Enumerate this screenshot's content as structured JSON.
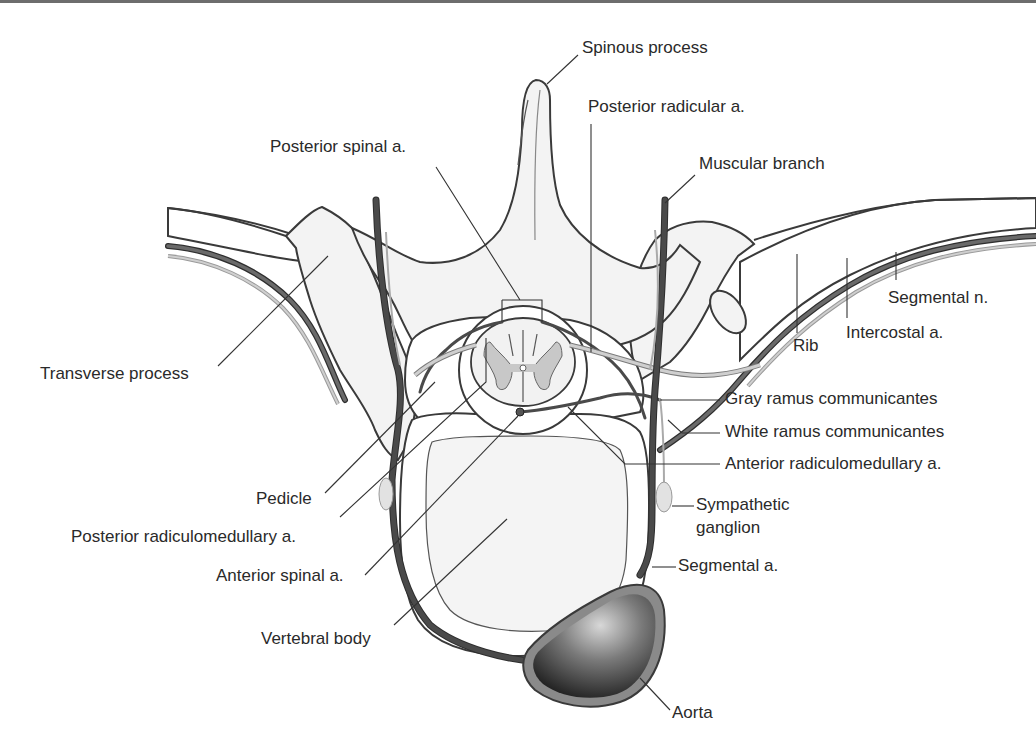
{
  "figure": {
    "colors": {
      "outline": "#3a3a3a",
      "artery": "#4a4a4a",
      "nerve_fill": "#d6d6d6",
      "gray_matter": "#c8c8c8",
      "aorta_dark": "#2b2b2b",
      "aorta_wall": "#8a8a8a",
      "label_text": "#2a2a2a"
    }
  },
  "labels": {
    "spinous_process": "Spinous process",
    "posterior_radicular": "Posterior radicular a.",
    "posterior_spinal": "Posterior spinal a.",
    "muscular_branch": "Muscular branch",
    "segmental_n": "Segmental n.",
    "intercostal_a": "Intercostal a.",
    "rib": "Rib",
    "transverse_process": "Transverse process",
    "gray_ramus": "Gray ramus communicantes",
    "white_ramus": "White ramus communicantes",
    "anterior_radiculomedullary": "Anterior radiculomedullary a.",
    "pedicle": "Pedicle",
    "sympathetic_ganglion_line1": "Sympathetic",
    "sympathetic_ganglion_line2": "ganglion",
    "posterior_radiculomedullary": "Posterior radiculomedullary a.",
    "anterior_spinal": "Anterior spinal a.",
    "segmental_a": "Segmental a.",
    "vertebral_body": "Vertebral body",
    "aorta": "Aorta"
  }
}
